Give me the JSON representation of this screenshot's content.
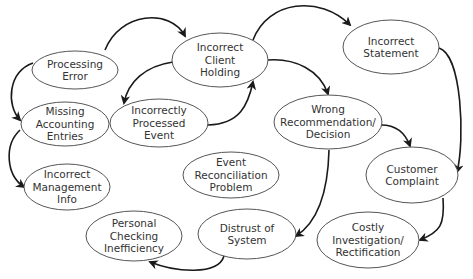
{
  "diagram": {
    "type": "cause-effect flow",
    "nodes": [
      {
        "id": "processing_error",
        "lines": [
          "Processing",
          "Error"
        ],
        "cx": 75,
        "cy": 70,
        "rx": 43,
        "ry": 19
      },
      {
        "id": "incorrect_client_holding",
        "lines": [
          "Incorrect",
          "Client",
          "Holding"
        ],
        "cx": 220,
        "cy": 60,
        "rx": 48,
        "ry": 27
      },
      {
        "id": "incorrect_statement",
        "lines": [
          "Incorrect",
          "Statement"
        ],
        "cx": 391,
        "cy": 47,
        "rx": 48,
        "ry": 27
      },
      {
        "id": "missing_accounting_entries",
        "lines": [
          "Missing",
          "Accounting",
          "Entries"
        ],
        "cx": 65,
        "cy": 124,
        "rx": 44,
        "ry": 22
      },
      {
        "id": "incorrectly_processed_event",
        "lines": [
          "Incorrectly",
          "Processed",
          "Event"
        ],
        "cx": 159,
        "cy": 123,
        "rx": 49,
        "ry": 24
      },
      {
        "id": "wrong_recommendation_decision",
        "lines": [
          "Wrong",
          "Recommendation/",
          "Decision"
        ],
        "cx": 328,
        "cy": 122,
        "rx": 54,
        "ry": 27
      },
      {
        "id": "incorrect_management_info",
        "lines": [
          "Incorrect",
          "Management",
          "Info"
        ],
        "cx": 67,
        "cy": 187,
        "rx": 43,
        "ry": 23
      },
      {
        "id": "event_reconciliation_problem",
        "lines": [
          "Event",
          "Reconciliation",
          "Problem"
        ],
        "cx": 231,
        "cy": 175,
        "rx": 48,
        "ry": 23
      },
      {
        "id": "customer_complaint",
        "lines": [
          "Customer",
          "Complaint"
        ],
        "cx": 412,
        "cy": 175,
        "rx": 46,
        "ry": 28
      },
      {
        "id": "personal_checking_inefficiency",
        "lines": [
          "Personal",
          "Checking",
          "Inefficiency"
        ],
        "cx": 134,
        "cy": 236,
        "rx": 48,
        "ry": 25
      },
      {
        "id": "distrust_of_system",
        "lines": [
          "Distrust of",
          "System"
        ],
        "cx": 247,
        "cy": 234,
        "rx": 49,
        "ry": 25
      },
      {
        "id": "costly_investigation_rectification",
        "lines": [
          "Costly",
          "Investigation/",
          "Rectification"
        ],
        "cx": 368,
        "cy": 240,
        "rx": 51,
        "ry": 28
      }
    ],
    "edges": [
      {
        "from": "processing_error",
        "to": "incorrect_client_holding",
        "path": "M105,50 C120,12 170,8 185,36"
      },
      {
        "from": "processing_error",
        "to": "missing_accounting_entries",
        "path": "M33,63 C8,72 6,105 20,120"
      },
      {
        "from": "missing_accounting_entries",
        "to": "incorrect_management_info",
        "path": "M20,130 C4,145 6,175 24,187"
      },
      {
        "from": "incorrect_client_holding",
        "to": "incorrectly_processed_event",
        "path": "M173,62 C145,66 128,82 124,103"
      },
      {
        "from": "incorrectly_processed_event",
        "to": "incorrect_client_holding",
        "path": "M208,125 C240,124 248,105 253,82"
      },
      {
        "from": "incorrect_client_holding",
        "to": "incorrect_statement",
        "path": "M253,40 C268,0 320,-5 350,25"
      },
      {
        "from": "incorrect_client_holding",
        "to": "wrong_recommendation_decision",
        "path": "M268,60 C295,58 320,70 328,94"
      },
      {
        "from": "incorrect_statement",
        "to": "customer_complaint",
        "path": "M439,48 C462,55 465,140 457,172"
      },
      {
        "from": "wrong_recommendation_decision",
        "to": "customer_complaint",
        "path": "M381,125 C395,125 405,132 410,146"
      },
      {
        "from": "customer_complaint",
        "to": "costly_investigation_rectification",
        "path": "M443,198 C445,225 440,232 420,240"
      },
      {
        "from": "wrong_recommendation_decision",
        "to": "distrust_of_system",
        "path": "M329,150 C328,190 318,222 296,236"
      },
      {
        "from": "distrust_of_system",
        "to": "personal_checking_inefficiency",
        "path": "M224,256 C218,276 175,272 150,262"
      }
    ]
  }
}
